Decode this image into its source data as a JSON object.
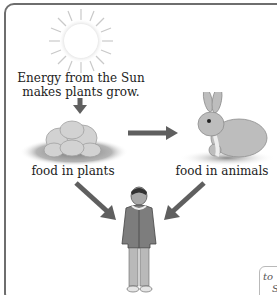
{
  "diagram": {
    "sun_caption_line1": "Energy from the Sun",
    "sun_caption_line2": "makes plants grow.",
    "plants_label": "food in plants",
    "animals_label": "food in animals",
    "side_note_fragment_line1": "to",
    "side_note_fragment_line2": "S",
    "colors": {
      "frame_border": "#6e6e6e",
      "arrow": "#5f5f5f",
      "text": "#222222"
    }
  }
}
